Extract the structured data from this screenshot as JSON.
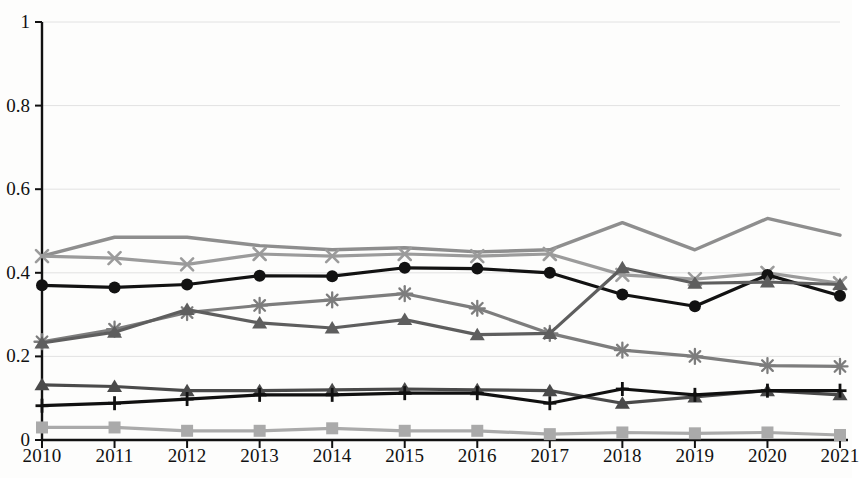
{
  "chart_data": {
    "type": "line",
    "title": "",
    "subtitle": "",
    "xlabel": "",
    "ylabel": "",
    "categories": [
      "2010",
      "2011",
      "2012",
      "2013",
      "2014",
      "2015",
      "2016",
      "2017",
      "2018",
      "2019",
      "2020",
      "2021"
    ],
    "x": [
      2010,
      2011,
      2012,
      2013,
      2014,
      2015,
      2016,
      2017,
      2018,
      2019,
      2020,
      2021
    ],
    "ylim": [
      0,
      1
    ],
    "xlim": [
      2010,
      2021
    ],
    "yticks": [
      "0",
      "0.2",
      "0.4",
      "0.6",
      "0.8",
      "1"
    ],
    "ytick_values": [
      0,
      0.2,
      0.4,
      0.6,
      0.8,
      1
    ],
    "grid": true,
    "grid_axis": "y",
    "legend": "none",
    "legend_position": "none",
    "annotations": [],
    "series": [
      {
        "name": "Series 1",
        "marker": "none",
        "color": "#8e8e8e",
        "values": [
          0.44,
          0.485,
          0.485,
          0.465,
          0.455,
          0.46,
          0.45,
          0.455,
          0.52,
          0.455,
          0.53,
          0.49
        ]
      },
      {
        "name": "Series 2",
        "marker": "x",
        "color": "#9b9b9b",
        "values": [
          0.44,
          0.435,
          0.42,
          0.445,
          0.44,
          0.445,
          0.44,
          0.445,
          0.395,
          0.385,
          0.4,
          0.375
        ]
      },
      {
        "name": "Series 3",
        "marker": "circle",
        "color": "#121212",
        "values": [
          0.37,
          0.365,
          0.372,
          0.393,
          0.392,
          0.412,
          0.41,
          0.4,
          0.348,
          0.32,
          0.395,
          0.345
        ]
      },
      {
        "name": "Series 4",
        "marker": "asterisk",
        "color": "#7d7d7d",
        "values": [
          0.235,
          0.265,
          0.305,
          0.322,
          0.335,
          0.35,
          0.315,
          0.255,
          0.215,
          0.2,
          0.178,
          0.176
        ]
      },
      {
        "name": "Series 5",
        "marker": "triangle",
        "color": "#5e5e5e",
        "values": [
          0.232,
          0.258,
          0.312,
          0.28,
          0.268,
          0.288,
          0.252,
          0.255,
          0.412,
          0.375,
          0.378,
          0.372
        ]
      },
      {
        "name": "Series 6",
        "marker": "triangle",
        "color": "#4a4a4a",
        "values": [
          0.132,
          0.128,
          0.118,
          0.118,
          0.12,
          0.122,
          0.12,
          0.118,
          0.088,
          0.103,
          0.118,
          0.108
        ]
      },
      {
        "name": "Series 7",
        "marker": "plus",
        "color": "#101010",
        "values": [
          0.082,
          0.088,
          0.098,
          0.108,
          0.108,
          0.112,
          0.112,
          0.088,
          0.122,
          0.108,
          0.118,
          0.118
        ]
      },
      {
        "name": "Series 8",
        "marker": "square",
        "color": "#aaaaaa",
        "values": [
          0.03,
          0.03,
          0.022,
          0.022,
          0.028,
          0.022,
          0.022,
          0.014,
          0.018,
          0.016,
          0.018,
          0.012
        ]
      }
    ]
  },
  "axes": {
    "axis_color": "#111111",
    "grid_color": "#e2e2e2"
  }
}
